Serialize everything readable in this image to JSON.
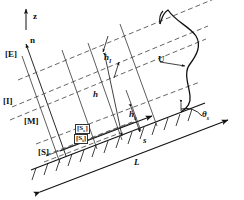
{
  "figure": {
    "type": "diagram",
    "colors": {
      "ink": "#111111",
      "solid_line": "#1a1a1a",
      "dashed_line": "#555555",
      "background": "#ffffff"
    }
  },
  "axes": {
    "vertical": {
      "label": "z",
      "description": "vertical unit vector, points up"
    },
    "slope_normal": {
      "label": "n",
      "description": "slope-normal unit vector"
    }
  },
  "layers": [
    {
      "id": "E",
      "label": "[E]",
      "name": "exterior-layer"
    },
    {
      "id": "I",
      "label": "[I]",
      "name": "interface-layer"
    },
    {
      "id": "M",
      "label": "[M]",
      "name": "mixed-layer"
    },
    {
      "id": "S",
      "label": "[S]",
      "name": "surface-layer"
    }
  ],
  "sublayers": [
    {
      "id": "Se",
      "label": "[S",
      "sub": "e",
      "close": "]",
      "name": "outer-surface-sublayer"
    },
    {
      "id": "Si",
      "label": "[S",
      "sub": "i",
      "close": "]",
      "name": "inner-surface-sublayer"
    }
  ],
  "dimensions": [
    {
      "id": "hI",
      "label": "h",
      "sub": "I",
      "name": "interface-layer-thickness"
    },
    {
      "id": "h",
      "label": "h",
      "sub": "",
      "name": "total-boundary-layer-thickness"
    },
    {
      "id": "hs",
      "label": "h",
      "sub": "s",
      "name": "surface-layer-thickness"
    }
  ],
  "velocity": {
    "label": "U",
    "name": "along-slope-velocity-profile"
  },
  "slope": {
    "along_slope_coordinate": {
      "label": "s",
      "name": "along-slope-coordinate"
    },
    "length": {
      "label": "L",
      "name": "slope-length"
    },
    "angle": {
      "label": "θ",
      "sub": "s",
      "name": "slope-angle"
    }
  }
}
